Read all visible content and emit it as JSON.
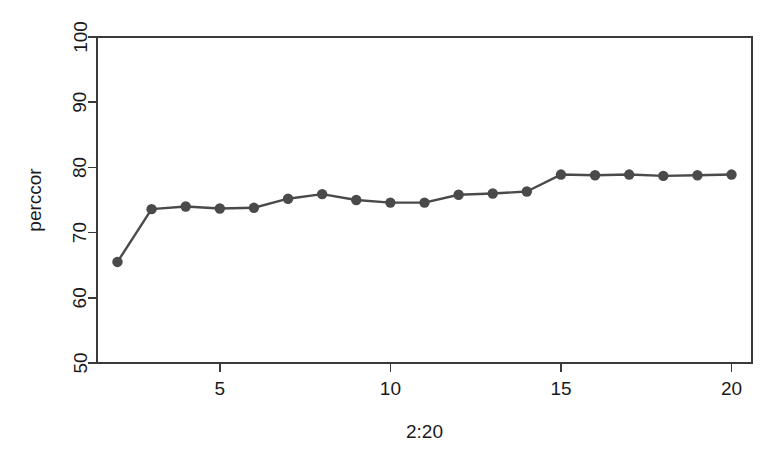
{
  "chart_data": {
    "type": "line",
    "title": "",
    "xlabel": "2:20",
    "ylabel": "perccor",
    "x": [
      2,
      3,
      4,
      5,
      6,
      7,
      8,
      9,
      10,
      11,
      12,
      13,
      14,
      15,
      16,
      17,
      18,
      19,
      20
    ],
    "values": [
      65.5,
      73.6,
      74.0,
      73.7,
      73.8,
      75.2,
      75.9,
      75.0,
      74.6,
      74.6,
      75.8,
      76.0,
      76.3,
      78.9,
      78.8,
      78.9,
      78.7,
      78.8,
      78.9
    ],
    "series": [
      {
        "name": "perccor",
        "values": [
          65.5,
          73.6,
          74.0,
          73.7,
          73.8,
          75.2,
          75.9,
          75.0,
          74.6,
          74.6,
          75.8,
          76.0,
          76.3,
          78.9,
          78.8,
          78.9,
          78.7,
          78.8,
          78.9
        ]
      }
    ],
    "xlim": [
      1.4,
      20.6
    ],
    "ylim": [
      50,
      100
    ],
    "xticks": [
      5,
      10,
      15,
      20
    ],
    "xtick_labels": [
      "5",
      "10",
      "15",
      "20"
    ],
    "yticks": [
      50,
      60,
      70,
      80,
      90,
      100
    ],
    "ytick_labels": [
      "50",
      "60",
      "70",
      "80",
      "90",
      "100"
    ],
    "grid": false,
    "legend": false,
    "marker": "filled-circle",
    "line_color": "#4a4a4a",
    "marker_color": "#4a4a4a",
    "axis_color": "#3a3a3a",
    "background": "#ffffff"
  }
}
